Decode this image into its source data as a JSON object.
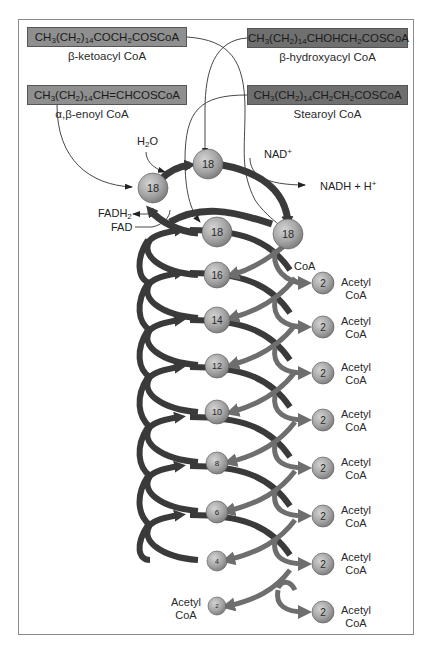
{
  "compounds": {
    "beta_ketoacyl": {
      "formula_parts": [
        "CH",
        "3",
        "(CH",
        "2",
        ")",
        "14",
        "COCH",
        "2",
        "COSCoA"
      ],
      "name": "β-ketoacyl CoA"
    },
    "beta_hydroxyacyl": {
      "formula_parts": [
        "CH",
        "3",
        "(CH",
        "2",
        ")",
        "14",
        "CHOHCH",
        "2",
        "COSCoA"
      ],
      "name": "β-hydroxyacyl CoA"
    },
    "enoyl": {
      "formula_parts": [
        "CH",
        "3",
        "(CH",
        "2",
        ")",
        "14",
        "CH=CHCOSCoA"
      ],
      "name": "α,β-enoyl CoA"
    },
    "stearoyl": {
      "formula_parts": [
        "CH",
        "3",
        "(CH",
        "2",
        ")",
        "14",
        "CH",
        "2",
        "CH",
        "2",
        "COSCoA"
      ],
      "name": "Stearoyl CoA"
    }
  },
  "cofactors": {
    "h2o": {
      "main": "H",
      "sub": "2",
      "tail": "O"
    },
    "nad": {
      "main": "NAD",
      "sup": "+"
    },
    "nadh": {
      "main": "NADH + H",
      "sup": "+"
    },
    "fadh2": {
      "main": "FADH",
      "sub": "2"
    },
    "fad": "FAD",
    "coa": "CoA"
  },
  "first_cycle_nodes": [
    "18",
    "18",
    "18",
    "18"
  ],
  "chain_nodes": [
    "16",
    "14",
    "12",
    "10",
    "8",
    "6",
    "4"
  ],
  "final_node": {
    "value": "2",
    "label_line1": "Acetyl",
    "label_line2": "CoA"
  },
  "acetyl_products": [
    {
      "value": "2",
      "line1": "Acetyl",
      "line2": "CoA"
    },
    {
      "value": "2",
      "line1": "Acetyl",
      "line2": "CoA"
    },
    {
      "value": "2",
      "line1": "Acetyl",
      "line2": "CoA"
    },
    {
      "value": "2",
      "line1": "Acetyl",
      "line2": "CoA"
    },
    {
      "value": "2",
      "line1": "Acetyl",
      "line2": "CoA"
    },
    {
      "value": "2",
      "line1": "Acetyl",
      "line2": "CoA"
    },
    {
      "value": "2",
      "line1": "Acetyl",
      "line2": "CoA"
    },
    {
      "value": "2",
      "line1": "Acetyl",
      "line2": "CoA"
    }
  ],
  "colors": {
    "spiral_dark": "#3a3a3a",
    "arrow_gray": "#6e6e6e",
    "node_fill": "#a8a8a8",
    "box_light": "#8f8f8f",
    "box_dark": "#6f6f6f"
  }
}
